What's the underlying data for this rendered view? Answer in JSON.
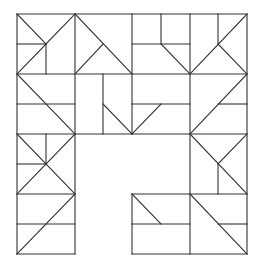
{
  "diagram": {
    "type": "geometric-tile-pattern",
    "stroke_color": "#333333",
    "background": "#ffffff",
    "lines": [
      [
        17,
        14,
        247,
        14
      ],
      [
        17,
        14,
        17,
        254
      ],
      [
        247,
        14,
        247,
        254
      ],
      [
        17,
        254,
        75,
        254
      ],
      [
        132,
        254,
        247,
        254
      ],
      [
        75,
        134,
        75,
        254
      ],
      [
        132,
        194,
        132,
        254
      ],
      [
        75,
        134,
        132,
        134
      ],
      [
        132,
        194,
        190,
        194
      ],
      [
        17,
        74,
        247,
        74
      ],
      [
        17,
        134,
        75,
        134
      ],
      [
        132,
        134,
        247,
        134
      ],
      [
        17,
        194,
        75,
        194
      ],
      [
        190,
        194,
        247,
        194
      ],
      [
        75,
        14,
        75,
        134
      ],
      [
        132,
        14,
        132,
        134
      ],
      [
        190,
        14,
        190,
        254
      ],
      [
        17,
        14,
        46,
        44
      ],
      [
        46,
        44,
        75,
        14
      ],
      [
        46,
        44,
        17,
        74
      ],
      [
        17,
        44,
        46,
        44
      ],
      [
        46,
        44,
        46,
        74
      ],
      [
        75,
        14,
        132,
        74
      ],
      [
        103,
        44,
        75,
        74
      ],
      [
        132,
        44,
        190,
        44
      ],
      [
        161,
        14,
        161,
        44
      ],
      [
        161,
        44,
        190,
        74
      ],
      [
        218,
        14,
        218,
        44
      ],
      [
        247,
        14,
        190,
        74
      ],
      [
        218,
        44,
        247,
        74
      ],
      [
        17,
        104,
        75,
        104
      ],
      [
        17,
        74,
        75,
        134
      ],
      [
        103,
        74,
        103,
        134
      ],
      [
        103,
        104,
        132,
        134
      ],
      [
        132,
        104,
        190,
        104
      ],
      [
        161,
        104,
        132,
        134
      ],
      [
        247,
        74,
        190,
        134
      ],
      [
        218,
        104,
        247,
        104
      ],
      [
        17,
        134,
        75,
        194
      ],
      [
        75,
        134,
        17,
        194
      ],
      [
        46,
        134,
        46,
        164
      ],
      [
        17,
        164,
        46,
        164
      ],
      [
        17,
        224,
        75,
        224
      ],
      [
        75,
        194,
        17,
        254
      ],
      [
        190,
        134,
        247,
        194
      ],
      [
        218,
        164,
        247,
        134
      ],
      [
        218,
        164,
        218,
        194
      ],
      [
        132,
        224,
        190,
        224
      ],
      [
        132,
        194,
        161,
        224
      ],
      [
        190,
        194,
        247,
        254
      ],
      [
        218,
        224,
        247,
        224
      ]
    ]
  }
}
